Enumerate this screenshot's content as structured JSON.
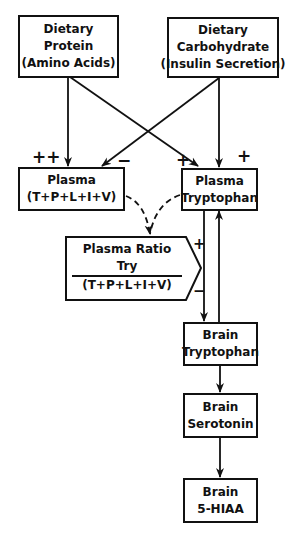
{
  "nodes": {
    "dietary_protein": {
      "lines": [
        "Dietary",
        "Protein",
        "(Amino Acids)"
      ]
    },
    "dietary_carbohydrate": {
      "lines": [
        "Dietary",
        "Carbohydrate",
        "(Insulin Secretion)"
      ]
    },
    "plasma_lnaa": {
      "lines": [
        "Plasma",
        "(T+P+L+I+V)"
      ]
    },
    "plasma_tryptophan": {
      "lines": [
        "Plasma",
        "Tryptophan"
      ]
    },
    "plasma_ratio": {
      "title": "Plasma Ratio",
      "numerator": "Try",
      "denominator": "(T+P+L+I+V)"
    },
    "brain_tryptophan": {
      "lines": [
        "Brain",
        "Tryptophan"
      ]
    },
    "brain_serotonin": {
      "lines": [
        "Brain",
        "Serotonin"
      ]
    },
    "brain_5hiaa": {
      "lines": [
        "Brain",
        "5-HIAA"
      ]
    }
  },
  "signs": {
    "protein_to_plasma": "++",
    "carb_to_plasma": "−",
    "protein_to_tryptophan": "+",
    "carb_to_tryptophan": "+",
    "ratio_plus": "+",
    "ratio_minus": "−"
  },
  "edges": [
    {
      "from": "dietary_protein",
      "to": "plasma_lnaa",
      "sign": "++",
      "style": "solid"
    },
    {
      "from": "dietary_protein",
      "to": "plasma_tryptophan",
      "sign": "+",
      "style": "solid"
    },
    {
      "from": "dietary_carbohydrate",
      "to": "plasma_lnaa",
      "sign": "-",
      "style": "solid"
    },
    {
      "from": "dietary_carbohydrate",
      "to": "plasma_tryptophan",
      "sign": "+",
      "style": "solid"
    },
    {
      "from": "plasma_lnaa",
      "to": "plasma_ratio",
      "style": "dashed"
    },
    {
      "from": "plasma_tryptophan",
      "to": "plasma_ratio",
      "style": "dashed"
    },
    {
      "from": "plasma_tryptophan",
      "to": "brain_tryptophan",
      "style": "solid"
    },
    {
      "from": "brain_tryptophan",
      "to": "plasma_tryptophan",
      "style": "solid"
    },
    {
      "from": "brain_tryptophan",
      "to": "brain_serotonin",
      "style": "solid"
    },
    {
      "from": "brain_serotonin",
      "to": "brain_5hiaa",
      "style": "solid"
    }
  ]
}
